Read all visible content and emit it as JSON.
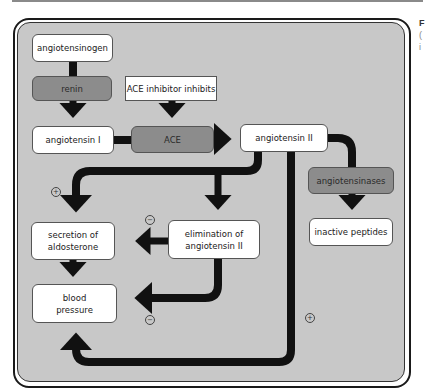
{
  "diagram": {
    "nodes": {
      "angiotensinogen": "angiotensinogen",
      "renin": "renin",
      "ace_inhibitor": "ACE inhibitor inhibits",
      "angiotensin_1": "angiotensin I",
      "ace": "ACE",
      "angiotensin_2": "angiotensin II",
      "angiotensinases": "angiotensinases",
      "inactive_peptides": "inactive peptides",
      "secretion_aldosterone_line1": "secretion of",
      "secretion_aldosterone_line2": "aldosterone",
      "elimination_line1": "elimination of",
      "elimination_line2": "angiotensin II",
      "blood_pressure_line1": "blood",
      "blood_pressure_line2": "pressure"
    },
    "signs": {
      "plus_secretion": "+",
      "minus_elimination_to_secretion": "−",
      "minus_elimination_to_bp": "−",
      "plus_direct_bp": "+"
    },
    "colors": {
      "panel_bg": "#c8c8c8",
      "enzyme_box": "#8c8c8c",
      "node_box": "#ffffff",
      "arrow": "#111111"
    }
  },
  "caption_fragments": [
    "F",
    "(",
    "i"
  ]
}
